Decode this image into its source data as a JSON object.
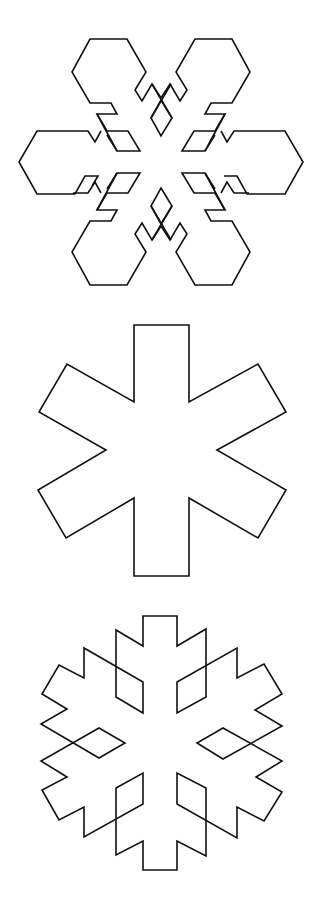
{
  "canvas": {
    "width": 316,
    "height": 905,
    "background": "#ffffff"
  },
  "colors": {
    "stroke": "#111111"
  },
  "figures": [
    {
      "id": "figure-1",
      "kind": "snowflake-hexagonal-arms",
      "center": [
        161,
        162
      ],
      "top": 20
    },
    {
      "id": "figure-2",
      "kind": "six-point-asterisk",
      "center": [
        162,
        450
      ],
      "top": 310
    },
    {
      "id": "figure-3",
      "kind": "koch-like-snowflake-with-diamonds",
      "center": [
        162,
        742
      ],
      "top": 605
    }
  ]
}
